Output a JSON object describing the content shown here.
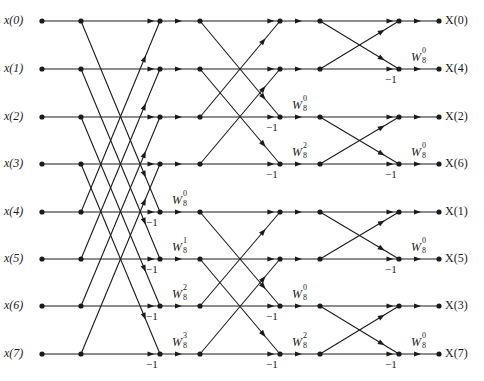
{
  "diagram": {
    "rows_y": [
      21,
      69,
      117,
      164,
      212,
      259,
      306,
      354
    ],
    "columns_x": {
      "input_dot": 42,
      "stage1_node": 81,
      "stage2_node": 160,
      "stage3_node": 200,
      "stage4_node": 280,
      "stage5_node": 320,
      "stage6_node": 399,
      "output_dot": 439
    },
    "line_color": "#1a1a1a",
    "inputs": [
      "x(0)",
      "x(1)",
      "x(2)",
      "x(3)",
      "x(4)",
      "x(5)",
      "x(6)",
      "x(7)"
    ],
    "outputs": [
      "X(0)",
      "X(4)",
      "X(2)",
      "X(6)",
      "X(1)",
      "X(5)",
      "X(3)",
      "X(7)"
    ],
    "stage1": {
      "span": 4,
      "twiddles": [
        {
          "row": 4,
          "base": "W",
          "sup": "0",
          "sub": "8"
        },
        {
          "row": 5,
          "base": "W",
          "sup": "1",
          "sub": "8"
        },
        {
          "row": 6,
          "base": "W",
          "sup": "2",
          "sub": "8"
        },
        {
          "row": 7,
          "base": "W",
          "sup": "3",
          "sub": "8"
        }
      ],
      "neg_rows": [
        4,
        5,
        6,
        7
      ],
      "neg_label": "−1"
    },
    "stage2": {
      "span": 2,
      "twiddles": [
        {
          "row": 2,
          "base": "W",
          "sup": "0",
          "sub": "8"
        },
        {
          "row": 3,
          "base": "W",
          "sup": "2",
          "sub": "8"
        },
        {
          "row": 6,
          "base": "W",
          "sup": "0",
          "sub": "8"
        },
        {
          "row": 7,
          "base": "W",
          "sup": "2",
          "sub": "8"
        }
      ],
      "neg_rows": [
        2,
        3,
        6,
        7
      ],
      "neg_label": "−1"
    },
    "stage3": {
      "span": 1,
      "twiddles": [
        {
          "row": 1,
          "base": "W",
          "sup": "0",
          "sub": "8"
        },
        {
          "row": 3,
          "base": "W",
          "sup": "0",
          "sub": "8"
        },
        {
          "row": 5,
          "base": "W",
          "sup": "0",
          "sub": "8"
        },
        {
          "row": 7,
          "base": "W",
          "sup": "0",
          "sub": "8"
        }
      ],
      "neg_rows": [
        1,
        3,
        5,
        7
      ],
      "neg_label": "−1"
    }
  }
}
